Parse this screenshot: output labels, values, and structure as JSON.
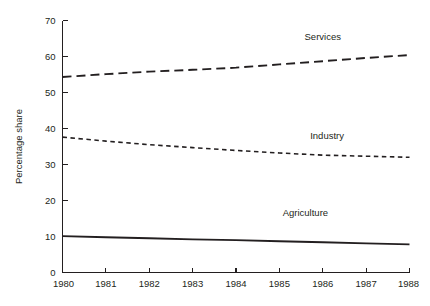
{
  "chart_data": {
    "type": "line",
    "title": "",
    "subtitle": "",
    "xlabel": "",
    "ylabel": "Percentage share",
    "x": [
      1980,
      1981,
      1982,
      1983,
      1984,
      1985,
      1986,
      1987,
      1988
    ],
    "xticklabels": [
      "1980",
      "1981",
      "1982",
      "1983",
      "1984",
      "1985",
      "1986",
      "1987",
      "1988"
    ],
    "yticklabels": [
      "0",
      "10",
      "20",
      "30",
      "40",
      "50",
      "60",
      "70"
    ],
    "yticks": [
      0,
      10,
      20,
      30,
      40,
      50,
      60,
      70
    ],
    "xlim": [
      1980,
      1988
    ],
    "ylim": [
      0,
      70
    ],
    "grid": false,
    "legend": "inline-annotations",
    "series": [
      {
        "name": "Services",
        "style": "long-dashed",
        "dasharray": "9,5",
        "width": 1.9,
        "color": "#231f20",
        "values": [
          54.3,
          55.1,
          55.8,
          56.3,
          56.9,
          57.8,
          58.7,
          59.6,
          60.4
        ]
      },
      {
        "name": "Industry",
        "style": "short-dashed",
        "dasharray": "4.5,3.5",
        "width": 1.6,
        "color": "#231f20",
        "values": [
          37.6,
          36.5,
          35.5,
          34.7,
          33.9,
          33.2,
          32.6,
          32.3,
          32.0
        ]
      },
      {
        "name": "Agriculture",
        "style": "solid",
        "dasharray": "none",
        "width": 1.9,
        "color": "#231f20",
        "values": [
          10.1,
          9.8,
          9.5,
          9.2,
          9.0,
          8.7,
          8.4,
          8.1,
          7.8
        ]
      }
    ],
    "annotations": [
      {
        "text": "Services",
        "x": 1986.0,
        "y": 64.5
      },
      {
        "text": "Industry",
        "x": 1986.1,
        "y": 37.0
      },
      {
        "text": "Agriculture",
        "x": 1985.6,
        "y": 15.8
      }
    ],
    "colors": {
      "ink": "#231f20",
      "background": "#ffffff"
    }
  }
}
